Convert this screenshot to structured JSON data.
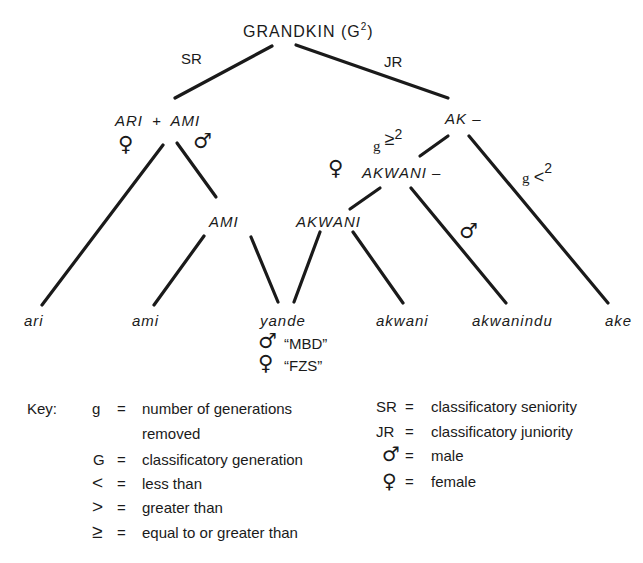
{
  "diagram": {
    "root": {
      "label": "GRANDKIN (G",
      "sup": "2",
      "close": ")"
    },
    "branches": {
      "left": "SR",
      "right": "JR"
    },
    "nodes": {
      "ari_ami": {
        "left": "ARI",
        "plus": "+",
        "right": "AMI"
      },
      "ak": "AK –",
      "ami_mid": "AMI",
      "akwani_mid": "AKWANI",
      "akwani_dash": "AKWANI –"
    },
    "conditions": {
      "ge": {
        "g": "g",
        "op": "≥",
        "n": "2"
      },
      "lt": {
        "g": "g",
        "op": "<",
        "n": "2"
      }
    },
    "symbols": {
      "female": "♀",
      "male": "♂"
    },
    "leaves": [
      "ari",
      "ami",
      "yande",
      "akwani",
      "akwanindu",
      "ake"
    ],
    "yande_glosses": [
      {
        "symbol": "♂",
        "text": "“MBD”"
      },
      {
        "symbol": "♀",
        "text": "“FZS”"
      }
    ]
  },
  "key": {
    "title": "Key:",
    "left": [
      {
        "term": "g",
        "eq": "=",
        "def": "number of generations",
        "def2": "removed"
      },
      {
        "term": "G",
        "eq": "=",
        "def": "classificatory generation"
      },
      {
        "term": "<",
        "eq": "=",
        "def": "less than"
      },
      {
        "term": ">",
        "eq": "=",
        "def": "greater than"
      },
      {
        "term": "≥",
        "eq": "=",
        "def": "equal to or greater than"
      }
    ],
    "right": [
      {
        "term": "SR",
        "eq": "=",
        "def": "classificatory seniority"
      },
      {
        "term": "JR",
        "eq": "=",
        "def": "classificatory juniority"
      },
      {
        "term": "♂",
        "eq": "=",
        "def": "male"
      },
      {
        "term": "♀",
        "eq": "=",
        "def": "female"
      }
    ]
  }
}
